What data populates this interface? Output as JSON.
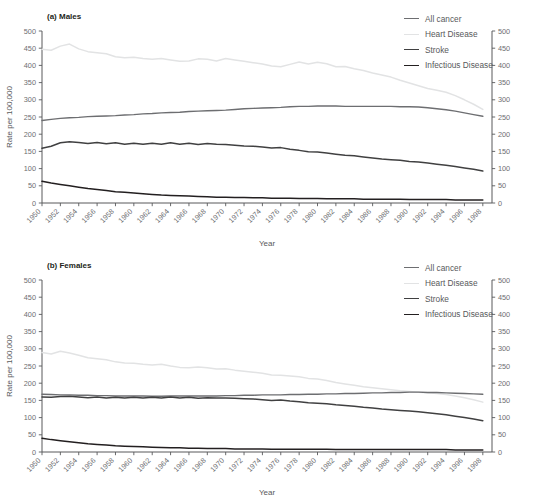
{
  "figure": {
    "title": "",
    "ylabel": "Rate per 100,000",
    "xlabel": "Year"
  },
  "legend": {
    "items": [
      {
        "label": "All cancer",
        "color": "#6d6e71"
      },
      {
        "label": "Heart Disease",
        "color": "#e2e3e4"
      },
      {
        "label": "Stroke",
        "color": "#404041"
      },
      {
        "label": "Infectious Disease",
        "color": "#231f20"
      }
    ]
  },
  "panels": [
    {
      "id": "a",
      "label": "(a) Males"
    },
    {
      "id": "b",
      "label": "(b) Females"
    }
  ],
  "chart_data": [
    {
      "type": "line",
      "title": "(a) Males",
      "xlabel": "Year",
      "ylabel": "Rate per 100,000",
      "ylim": [
        0,
        500
      ],
      "yticks": [
        0,
        50,
        100,
        150,
        200,
        250,
        300,
        350,
        400,
        450,
        500
      ],
      "xlim": [
        1950,
        1999
      ],
      "xticks": [
        1950,
        1952,
        1954,
        1956,
        1958,
        1960,
        1962,
        1964,
        1966,
        1968,
        1970,
        1972,
        1974,
        1976,
        1978,
        1980,
        1982,
        1984,
        1986,
        1988,
        1990,
        1992,
        1994,
        1996,
        1998
      ],
      "grid": false,
      "legend_position": "top-right",
      "right_axis": true,
      "x": [
        1950,
        1951,
        1952,
        1953,
        1954,
        1955,
        1956,
        1957,
        1958,
        1959,
        1960,
        1961,
        1962,
        1963,
        1964,
        1965,
        1966,
        1967,
        1968,
        1969,
        1970,
        1971,
        1972,
        1973,
        1974,
        1975,
        1976,
        1977,
        1978,
        1979,
        1980,
        1981,
        1982,
        1983,
        1984,
        1985,
        1986,
        1987,
        1988,
        1989,
        1990,
        1991,
        1992,
        1993,
        1994,
        1995,
        1996,
        1997,
        1998
      ],
      "series": [
        {
          "name": "All cancer",
          "color": "#6d6e71",
          "values": [
            240,
            243,
            246,
            248,
            249,
            251,
            252,
            253,
            254,
            256,
            257,
            259,
            260,
            262,
            263,
            264,
            266,
            267,
            268,
            269,
            270,
            272,
            274,
            275,
            276,
            277,
            278,
            280,
            281,
            281,
            282,
            282,
            282,
            281,
            281,
            281,
            281,
            281,
            281,
            280,
            280,
            279,
            277,
            274,
            271,
            267,
            262,
            257,
            252
          ]
        },
        {
          "name": "Heart Disease",
          "color": "#e2e3e4",
          "values": [
            447,
            444,
            456,
            462,
            448,
            440,
            437,
            434,
            425,
            422,
            424,
            420,
            418,
            420,
            416,
            412,
            413,
            419,
            418,
            413,
            420,
            416,
            412,
            408,
            404,
            398,
            396,
            403,
            410,
            404,
            409,
            405,
            396,
            397,
            390,
            385,
            378,
            372,
            366,
            357,
            349,
            341,
            333,
            328,
            322,
            312,
            300,
            287,
            272
          ]
        },
        {
          "name": "Stroke",
          "color": "#404041",
          "values": [
            159,
            165,
            175,
            178,
            176,
            173,
            176,
            172,
            175,
            171,
            174,
            171,
            174,
            171,
            175,
            171,
            174,
            170,
            173,
            171,
            170,
            168,
            166,
            165,
            163,
            160,
            161,
            156,
            153,
            149,
            148,
            145,
            142,
            139,
            137,
            134,
            131,
            128,
            126,
            124,
            121,
            119,
            116,
            113,
            110,
            106,
            102,
            98,
            93
          ]
        },
        {
          "name": "Infectious Disease",
          "color": "#231f20",
          "values": [
            63,
            58,
            54,
            50,
            46,
            42,
            39,
            36,
            33,
            31,
            29,
            27,
            25,
            23,
            22,
            21,
            20,
            19,
            18,
            17,
            17,
            16,
            16,
            15,
            15,
            14,
            14,
            14,
            13,
            13,
            13,
            12,
            12,
            12,
            12,
            11,
            11,
            11,
            11,
            11,
            10,
            10,
            10,
            10,
            10,
            9,
            9,
            9,
            9
          ]
        }
      ]
    },
    {
      "type": "line",
      "title": "(b) Females",
      "xlabel": "Year",
      "ylabel": "Rate per 100,000",
      "ylim": [
        0,
        500
      ],
      "yticks": [
        0,
        50,
        100,
        150,
        200,
        250,
        300,
        350,
        400,
        450,
        500
      ],
      "xlim": [
        1950,
        1999
      ],
      "xticks": [
        1950,
        1952,
        1954,
        1956,
        1958,
        1960,
        1962,
        1964,
        1966,
        1968,
        1970,
        1972,
        1974,
        1976,
        1978,
        1980,
        1982,
        1984,
        1986,
        1988,
        1990,
        1992,
        1994,
        1996,
        1998
      ],
      "grid": false,
      "legend_position": "top-right",
      "right_axis": true,
      "x": [
        1950,
        1951,
        1952,
        1953,
        1954,
        1955,
        1956,
        1957,
        1958,
        1959,
        1960,
        1961,
        1962,
        1963,
        1964,
        1965,
        1966,
        1967,
        1968,
        1969,
        1970,
        1971,
        1972,
        1973,
        1974,
        1975,
        1976,
        1977,
        1978,
        1979,
        1980,
        1981,
        1982,
        1983,
        1984,
        1985,
        1986,
        1987,
        1988,
        1989,
        1990,
        1991,
        1992,
        1993,
        1994,
        1995,
        1996,
        1997,
        1998
      ],
      "series": [
        {
          "name": "All cancer",
          "color": "#6d6e71",
          "values": [
            168,
            167,
            166,
            166,
            165,
            165,
            164,
            164,
            163,
            163,
            163,
            163,
            162,
            162,
            163,
            163,
            163,
            163,
            163,
            163,
            164,
            164,
            165,
            165,
            166,
            166,
            166,
            167,
            167,
            168,
            168,
            169,
            169,
            170,
            170,
            171,
            172,
            172,
            173,
            173,
            174,
            174,
            173,
            173,
            172,
            171,
            170,
            169,
            168
          ]
        },
        {
          "name": "Heart Disease",
          "color": "#e2e3e4",
          "values": [
            289,
            285,
            293,
            288,
            281,
            274,
            271,
            268,
            262,
            259,
            258,
            255,
            253,
            255,
            250,
            246,
            245,
            247,
            245,
            241,
            242,
            238,
            235,
            232,
            229,
            224,
            223,
            221,
            219,
            214,
            212,
            208,
            202,
            198,
            194,
            190,
            187,
            184,
            181,
            178,
            176,
            174,
            172,
            170,
            167,
            163,
            158,
            152,
            145
          ]
        },
        {
          "name": "Stroke",
          "color": "#404041",
          "values": [
            160,
            159,
            161,
            162,
            160,
            158,
            160,
            157,
            159,
            157,
            159,
            157,
            159,
            157,
            160,
            157,
            159,
            156,
            158,
            157,
            157,
            156,
            155,
            154,
            152,
            150,
            151,
            148,
            146,
            143,
            142,
            140,
            137,
            135,
            133,
            130,
            128,
            125,
            123,
            121,
            119,
            117,
            114,
            111,
            108,
            104,
            100,
            96,
            91
          ]
        },
        {
          "name": "Infectious Disease",
          "color": "#231f20",
          "values": [
            40,
            36,
            33,
            30,
            27,
            24,
            22,
            20,
            18,
            17,
            16,
            15,
            14,
            13,
            12,
            12,
            11,
            11,
            10,
            10,
            10,
            9,
            9,
            9,
            9,
            8,
            8,
            8,
            8,
            8,
            8,
            8,
            7,
            7,
            7,
            7,
            7,
            7,
            7,
            7,
            7,
            7,
            7,
            7,
            7,
            6,
            6,
            6,
            6
          ]
        }
      ]
    }
  ]
}
